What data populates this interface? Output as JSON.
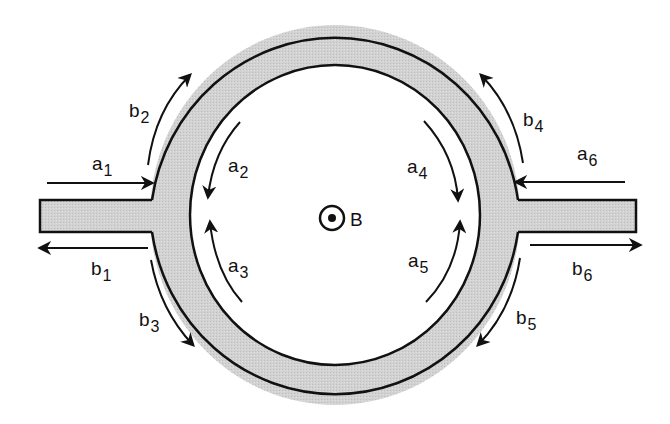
{
  "diagram": {
    "type": "circulator-ring-with-ports",
    "fill_color": "#cfcfcf",
    "stroke_color": "#111111",
    "field": {
      "symbol": "dot-in-circle-icon",
      "label": "B"
    },
    "labels": {
      "a1": {
        "base": "a",
        "sub": "1"
      },
      "b1": {
        "base": "b",
        "sub": "1"
      },
      "a2": {
        "base": "a",
        "sub": "2"
      },
      "b2": {
        "base": "b",
        "sub": "2"
      },
      "a3": {
        "base": "a",
        "sub": "3"
      },
      "b3": {
        "base": "b",
        "sub": "3"
      },
      "a4": {
        "base": "a",
        "sub": "4"
      },
      "b4": {
        "base": "b",
        "sub": "4"
      },
      "a5": {
        "base": "a",
        "sub": "5"
      },
      "b5": {
        "base": "b",
        "sub": "5"
      },
      "a6": {
        "base": "a",
        "sub": "6"
      },
      "b6": {
        "base": "b",
        "sub": "6"
      }
    }
  }
}
